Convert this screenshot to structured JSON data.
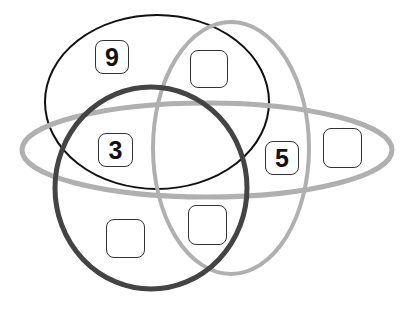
{
  "diagram": {
    "type": "venn",
    "sets": [
      {
        "id": "black-ellipse",
        "color": "#111111",
        "stroke_width": 2,
        "cx": 157,
        "cy": 102,
        "rx": 112,
        "ry": 87,
        "rotate": 0
      },
      {
        "id": "gray-vertical-ellipse",
        "color": "#b0b0b0",
        "stroke_width": 4,
        "cx": 231,
        "cy": 148,
        "rx": 78,
        "ry": 126,
        "rotate": 0
      },
      {
        "id": "gray-horizontal-ellipse",
        "color": "#b0b0b0",
        "stroke_width": 5,
        "cx": 207,
        "cy": 150,
        "rx": 185,
        "ry": 47,
        "rotate": 0
      },
      {
        "id": "dark-circle",
        "color": "#444444",
        "stroke_width": 5,
        "cx": 151,
        "cy": 188,
        "rx": 96,
        "ry": 101,
        "rotate": 0
      }
    ],
    "boxes": [
      {
        "label": "9",
        "x": 95,
        "y": 40,
        "w": 34,
        "h": 34
      },
      {
        "label": "",
        "x": 190,
        "y": 50,
        "w": 38,
        "h": 38
      },
      {
        "label": "3",
        "x": 98,
        "y": 133,
        "w": 35,
        "h": 34
      },
      {
        "label": "5",
        "x": 265,
        "y": 141,
        "w": 34,
        "h": 34
      },
      {
        "label": "",
        "x": 323,
        "y": 128,
        "w": 39,
        "h": 40
      },
      {
        "label": "",
        "x": 106,
        "y": 219,
        "w": 39,
        "h": 39
      },
      {
        "label": "",
        "x": 188,
        "y": 205,
        "w": 39,
        "h": 40
      }
    ]
  }
}
